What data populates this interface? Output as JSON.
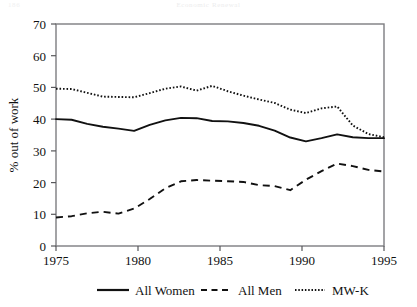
{
  "header": {
    "page_number": "186",
    "running_title": "Economic Renewal"
  },
  "chart_data": {
    "type": "line",
    "title": "",
    "xlabel": "",
    "ylabel": "% out of work",
    "xlim": [
      1975,
      1996
    ],
    "ylim": [
      0,
      70
    ],
    "xticks": [
      1975,
      1980,
      1985,
      1990,
      1995
    ],
    "xtick_labels": [
      "1975",
      "1980",
      "1985",
      "1990",
      "1995"
    ],
    "yticks": [
      0,
      10,
      20,
      30,
      40,
      50,
      60,
      70
    ],
    "ytick_labels": [
      "0",
      "10",
      "20",
      "30",
      "40",
      "50",
      "60",
      "70"
    ],
    "grid": false,
    "legend_position": "below",
    "x": [
      1975,
      1976,
      1977,
      1978,
      1979,
      1980,
      1981,
      1982,
      1983,
      1984,
      1985,
      1986,
      1987,
      1988,
      1989,
      1990,
      1991,
      1992,
      1993,
      1994,
      1995,
      1996
    ],
    "series": [
      {
        "name": "All Women",
        "style": "solid",
        "values": [
          40.0,
          39.8,
          38.5,
          37.6,
          37.0,
          36.3,
          38.2,
          39.6,
          40.4,
          40.3,
          39.4,
          39.3,
          38.8,
          37.9,
          36.4,
          34.2,
          33.0,
          34.0,
          35.2,
          34.3,
          34.0,
          34.0
        ]
      },
      {
        "name": "All Men",
        "style": "dashed",
        "values": [
          9.0,
          9.4,
          10.3,
          10.8,
          10.2,
          11.8,
          14.8,
          18.2,
          20.4,
          20.8,
          20.6,
          20.4,
          20.2,
          19.2,
          18.9,
          17.6,
          20.9,
          23.6,
          26.0,
          25.2,
          24.0,
          23.5
        ]
      },
      {
        "name": "MW-K",
        "style": "dotted",
        "values": [
          49.6,
          49.5,
          48.3,
          47.1,
          47.0,
          46.9,
          48.2,
          49.6,
          50.3,
          49.0,
          50.5,
          48.8,
          47.4,
          46.2,
          45.1,
          43.0,
          41.9,
          43.4,
          44.0,
          38.0,
          35.3,
          34.3
        ]
      }
    ],
    "legend": [
      {
        "label": "All Women",
        "style": "solid"
      },
      {
        "label": "All Men",
        "style": "dashed"
      },
      {
        "label": "MW-K",
        "style": "dotted"
      }
    ]
  }
}
